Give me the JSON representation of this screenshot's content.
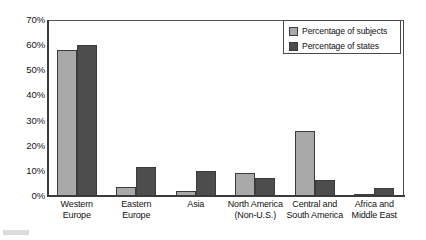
{
  "chart_data": {
    "type": "bar",
    "title": "",
    "xlabel": "",
    "ylabel": "",
    "ylim": [
      0,
      70
    ],
    "ytick_labels": [
      "70%",
      "60%",
      "50%",
      "40%",
      "30%",
      "20%",
      "10%",
      "0%"
    ],
    "ytick_values": [
      70,
      60,
      50,
      40,
      30,
      20,
      10,
      0
    ],
    "grid": false,
    "legend_position": "top-right",
    "categories": [
      "Western Europe",
      "Eastern Europe",
      "Asia",
      "North America (Non-U.S.)",
      "Central and South America",
      "Africa and Middle East"
    ],
    "category_lines": [
      [
        "Western",
        "Europe"
      ],
      [
        "Eastern",
        "Europe"
      ],
      [
        "Asia",
        ""
      ],
      [
        "North America",
        "(Non-U.S.)"
      ],
      [
        "Central and",
        "South America"
      ],
      [
        "Africa and",
        "Middle East"
      ]
    ],
    "series": [
      {
        "name": "Percentage of subjects",
        "color": "#a9a9a9",
        "values": [
          58,
          3.5,
          2,
          9,
          26,
          0.5
        ]
      },
      {
        "name": "Percentage of states",
        "color": "#4d4d4d",
        "values": [
          60,
          11.5,
          10,
          7,
          6.5,
          3
        ]
      }
    ]
  },
  "legend": {
    "items": [
      {
        "label": "Percentage of subjects",
        "swatch": "light"
      },
      {
        "label": "Percentage of states",
        "swatch": "dark"
      }
    ]
  },
  "colors": {
    "series_light": "#a9a9a9",
    "series_dark": "#4d4d4d",
    "axis": "#3a3a3a",
    "frame": "#4a4a4a",
    "background": "#ffffff",
    "text": "#121212"
  }
}
